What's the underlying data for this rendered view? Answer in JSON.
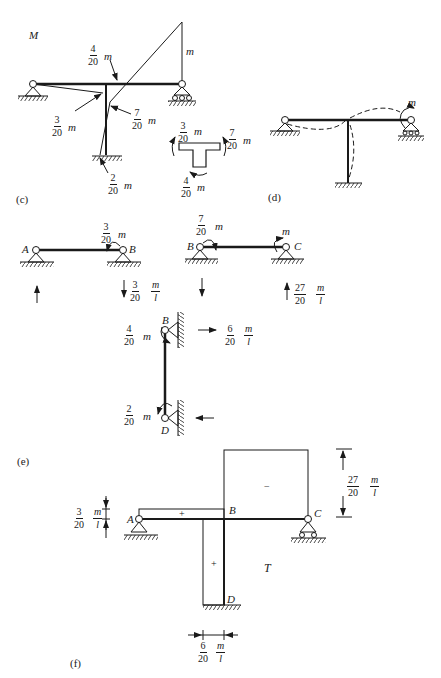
{
  "panels": {
    "c": {
      "label": "(c)",
      "title": "M",
      "top_moment": "m",
      "labels": [
        {
          "num": "4",
          "den": "20",
          "unit": "m"
        },
        {
          "num": "3",
          "den": "20",
          "unit": "m"
        },
        {
          "num": "7",
          "den": "20",
          "unit": "m"
        },
        {
          "num": "2",
          "den": "20",
          "unit": "m"
        }
      ],
      "joint": [
        {
          "num": "3",
          "den": "20",
          "unit": "m"
        },
        {
          "num": "7",
          "den": "20",
          "unit": "m"
        },
        {
          "num": "4",
          "den": "20",
          "unit": "m"
        }
      ]
    },
    "d": {
      "label": "(d)",
      "moment": "m"
    },
    "e": {
      "label": "(e)",
      "AB": {
        "node_a": "A",
        "node_b": "B",
        "moment": {
          "num": "3",
          "den": "20",
          "unit": "m"
        },
        "reaction": {
          "num": "3",
          "den": "20",
          "unum": "m",
          "uden": "l"
        }
      },
      "BC": {
        "node_b": "B",
        "node_c": "C",
        "moment_b": {
          "num": "7",
          "den": "20",
          "unit": "m"
        },
        "moment_c": "m",
        "reaction": {
          "num": "27",
          "den": "20",
          "unum": "m",
          "uden": "l"
        }
      },
      "BD": {
        "node_b": "B",
        "node_d": "D",
        "moment_b": {
          "num": "4",
          "den": "20",
          "unit": "m"
        },
        "moment_d": {
          "num": "2",
          "den": "20",
          "unit": "m"
        },
        "reaction": {
          "num": "6",
          "den": "20",
          "unum": "m",
          "uden": "l"
        }
      }
    },
    "f": {
      "label": "(f)",
      "title": "T",
      "node_a": "A",
      "node_b": "B",
      "node_c": "C",
      "node_d": "D",
      "sign_ab": "+",
      "sign_bc": "−",
      "sign_bd": "+",
      "dim_ab": {
        "num": "3",
        "den": "20",
        "unum": "m",
        "uden": "l"
      },
      "dim_bc": {
        "num": "27",
        "den": "20",
        "unum": "m",
        "uden": "l"
      },
      "dim_bd": {
        "num": "6",
        "den": "20",
        "unum": "m",
        "uden": "l"
      }
    }
  }
}
